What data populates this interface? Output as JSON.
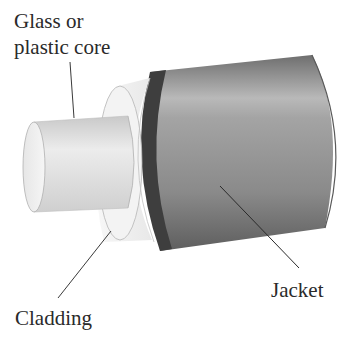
{
  "diagram": {
    "labels": {
      "core_line1": "Glass or",
      "core_line2": "plastic core",
      "cladding": "Cladding",
      "jacket": "Jacket"
    },
    "components": [
      {
        "name": "core",
        "label": "Glass or plastic core",
        "color": "#e2e2e2"
      },
      {
        "name": "cladding",
        "label": "Cladding",
        "color": "#f4f4f4"
      },
      {
        "name": "jacket",
        "label": "Jacket",
        "color": "#8f8f8f",
        "rim_color": "#3c3c3c"
      }
    ],
    "colors": {
      "background": "#ffffff",
      "text": "#2a2a2a",
      "leader_line": "#3a3a3a"
    }
  }
}
